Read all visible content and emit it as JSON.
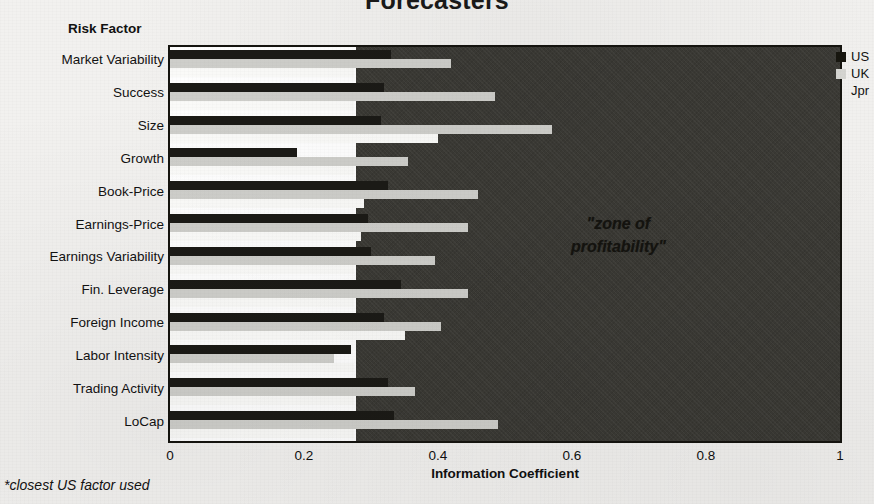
{
  "title": "Forecasters",
  "footnote": "*closest US factor used",
  "y_axis_title": "Risk Factor",
  "zone_label_lines": [
    "\"zone of",
    "profitability\""
  ],
  "legend": {
    "position": "right",
    "entries": [
      {
        "name": "US",
        "color": "#17160f"
      },
      {
        "name": "UK",
        "color": "#d6d6d2"
      },
      {
        "name": "Jpr",
        "color": "#ffffff"
      }
    ]
  },
  "chart_data": {
    "type": "bar",
    "orientation": "horizontal",
    "title": "Forecasters",
    "xlabel": "Information Coefficient",
    "ylabel": "Risk Factor",
    "xlim": [
      0,
      1
    ],
    "xticks": [
      "0",
      "0.2",
      "0.4",
      "0.6",
      "0.8",
      "1"
    ],
    "xtick_values": [
      0,
      0.2,
      0.4,
      0.6,
      0.8,
      1
    ],
    "grid": false,
    "legend_position": "right",
    "annotations": [
      {
        "text": "\"zone of profitability\"",
        "x_start": 0.277,
        "x_end": 1.0,
        "type": "shaded-region"
      },
      {
        "text": "*closest US factor used",
        "type": "footnote"
      }
    ],
    "zone_of_profitability_start": 0.277,
    "categories": [
      "Market Variability",
      "Success",
      "Size",
      "Growth",
      "Book-Price",
      "Earnings-Price",
      "Earnings Variability",
      "Fin. Leverage",
      "Foreign Income",
      "Labor Intensity",
      "Trading Activity",
      "LoCap"
    ],
    "series": [
      {
        "name": "US",
        "color": "#1b1a16",
        "values": [
          0.33,
          0.32,
          0.315,
          0.19,
          0.325,
          0.295,
          0.3,
          0.345,
          0.32,
          0.27,
          0.325,
          0.335
        ]
      },
      {
        "name": "UK",
        "color": "#cfcfcb",
        "values": [
          0.42,
          0.485,
          0.57,
          0.355,
          0.46,
          0.445,
          0.395,
          0.445,
          0.405,
          0.245,
          0.365,
          0.49
        ]
      },
      {
        "name": "Jpr",
        "color": "#ffffff",
        "values": [
          0.275,
          0.275,
          0.4,
          0.275,
          0.29,
          0.285,
          0.275,
          0.275,
          0.35,
          0.275,
          0.275,
          0.275
        ]
      }
    ]
  }
}
